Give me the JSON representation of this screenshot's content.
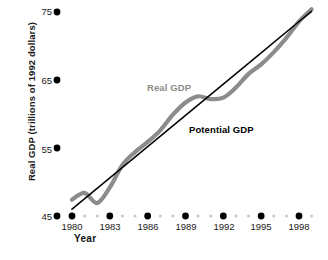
{
  "chart_data": {
    "type": "line",
    "title": "",
    "xlabel": "Year",
    "ylabel": "Real GDP (trillions of 1992 dollars)",
    "xlim": [
      1979.2,
      1999.2
    ],
    "ylim": [
      45,
      75
    ],
    "grid": false,
    "legend_position": "inline-annotations",
    "x_major_ticks": [
      1980,
      1983,
      1986,
      1989,
      1992,
      1995,
      1998
    ],
    "x_minor_ticks": [
      1981,
      1982,
      1984,
      1985,
      1987,
      1988,
      1990,
      1991,
      1993,
      1994,
      1996,
      1997,
      1999
    ],
    "y_ticks": [
      45,
      55,
      65,
      75
    ],
    "tick_style": "dots",
    "series": [
      {
        "name": "Real GDP",
        "style": "thick-gray",
        "color": "#8c8c8c",
        "x": [
          1980,
          1981,
          1982,
          1983,
          1984,
          1985,
          1986,
          1987,
          1988,
          1989,
          1990,
          1991,
          1992,
          1993,
          1994,
          1995,
          1996,
          1997,
          1998,
          1999
        ],
        "values": [
          47.4,
          48.4,
          46.9,
          49.2,
          52.5,
          54.4,
          55.9,
          57.6,
          59.9,
          61.7,
          62.6,
          62.2,
          62.4,
          63.9,
          65.9,
          67.3,
          69.1,
          71.2,
          73.6,
          75.4
        ]
      },
      {
        "name": "Potential GDP",
        "style": "thin-black",
        "color": "#000000",
        "x": [
          1980,
          1983,
          1986,
          1989,
          1992,
          1995,
          1998,
          1999
        ],
        "values": [
          46.0,
          50.6,
          55.2,
          59.8,
          64.4,
          69.0,
          73.6,
          75.1
        ]
      }
    ],
    "annotations": [
      {
        "text": "Real GDP",
        "color": "#8c8c8c"
      },
      {
        "text": "Potential GDP",
        "color": "#000000"
      }
    ]
  },
  "axes": {
    "y_title": "Real GDP (trillions of 1992 dollars)",
    "x_title": "Year",
    "y_tick_labels": [
      "75",
      "65",
      "55",
      "45"
    ],
    "x_tick_labels": [
      "1980",
      "1983",
      "1986",
      "1989",
      "1992",
      "1995",
      "1998"
    ]
  },
  "labels": {
    "real_gdp": "Real GDP",
    "potential_gdp": "Potential GDP"
  },
  "colors": {
    "real_gdp": "#8c8c8c",
    "potential_gdp": "#000000",
    "tick_major": "#000000",
    "tick_minor": "#c9c9c9",
    "text": "#1a1a1a",
    "background": "#ffffff"
  }
}
